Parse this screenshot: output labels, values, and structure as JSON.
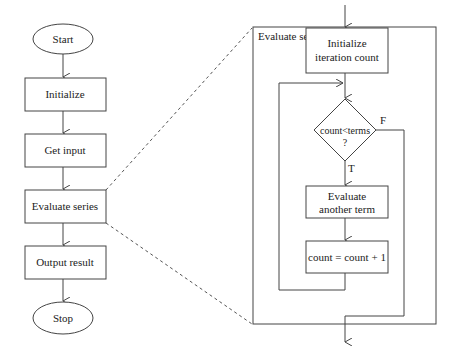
{
  "main_flow": {
    "start": "Start",
    "initialize": "Initialize",
    "get_input": "Get input",
    "evaluate_series": "Evaluate series",
    "output_result": "Output result",
    "stop": "Stop"
  },
  "detail": {
    "title": "Evaluate series",
    "init_line1": "Initialize",
    "init_line2": "iteration count",
    "decision_line1": "count<terms",
    "decision_line2": "?",
    "true_label": "T",
    "false_label": "F",
    "eval_line1": "Evaluate",
    "eval_line2": "another term",
    "increment": "count = count + 1"
  }
}
